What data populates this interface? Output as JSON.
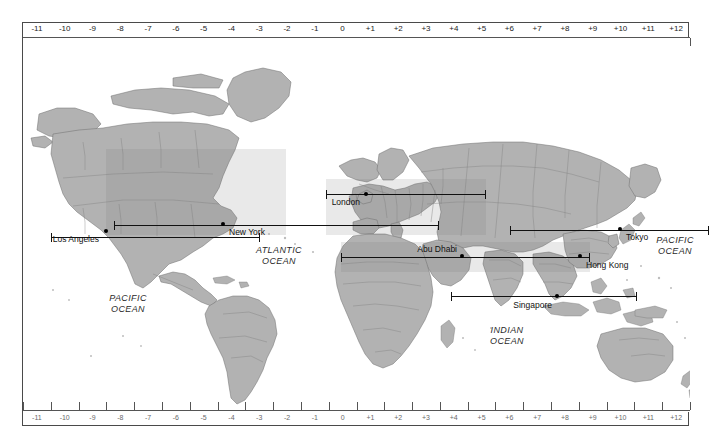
{
  "scale": {
    "top_labels": [
      "-11",
      "-10",
      "-9",
      "-8",
      "-7",
      "-6",
      "-5",
      "-4",
      "-3",
      "-2",
      "-1",
      "0",
      "+1",
      "+2",
      "+3",
      "+4",
      "+5",
      "+6",
      "+7",
      "+8",
      "+9",
      "+10",
      "+11",
      "+12"
    ],
    "bottom_labels": [
      "-11",
      "-10",
      "-9",
      "-8",
      "-7",
      "-6",
      "-5",
      "-4",
      "-3",
      "-2",
      "-1",
      "0",
      "+1",
      "+2",
      "+3",
      "+4",
      "+5",
      "+6",
      "+7",
      "+8",
      "+9",
      "+10",
      "+11",
      "+12"
    ],
    "offsets": [
      -11,
      -10,
      -9,
      -8,
      -7,
      -6,
      -5,
      -4,
      -3,
      -2,
      -1,
      0,
      1,
      2,
      3,
      4,
      5,
      6,
      7,
      8,
      9,
      10,
      11,
      12
    ],
    "min": -12,
    "max": 12
  },
  "cities": [
    {
      "name": "Los Angeles",
      "dot_x": 83,
      "dot_y": 208,
      "label_x": 76,
      "label_y": 211,
      "label_align": "right"
    },
    {
      "name": "New York",
      "dot_x": 200,
      "dot_y": 201,
      "label_x": 206,
      "label_y": 204,
      "label_align": "left"
    },
    {
      "name": "London",
      "dot_x": 343,
      "dot_y": 171,
      "label_x": 337,
      "label_y": 174,
      "label_align": "right"
    },
    {
      "name": "Abu Dhabi",
      "dot_x": 439,
      "dot_y": 233,
      "label_x": 434,
      "label_y": 221,
      "label_align": "right"
    },
    {
      "name": "Hong Kong",
      "dot_x": 557,
      "dot_y": 233,
      "label_x": 563,
      "label_y": 237,
      "label_align": "left"
    },
    {
      "name": "Tokyo",
      "dot_x": 597,
      "dot_y": 206,
      "label_x": 603,
      "label_y": 209,
      "label_align": "left"
    },
    {
      "name": "Singapore",
      "dot_x": 534,
      "dot_y": 273,
      "label_x": 529,
      "label_y": 277,
      "label_align": "right"
    }
  ],
  "route_bars": [
    {
      "name": "london-bar",
      "x": 303,
      "y": 171,
      "width": 160
    },
    {
      "name": "tokyo-bar",
      "x": 487,
      "y": 207,
      "width": 199
    },
    {
      "name": "losangeles-bar",
      "x": 28,
      "y": 214,
      "width": 209
    },
    {
      "name": "newyork-bar",
      "x": 91,
      "y": 202,
      "width": 325
    },
    {
      "name": "abudhabi-bar",
      "x": 318,
      "y": 234,
      "width": 249
    },
    {
      "name": "singapore-bar",
      "x": 428,
      "y": 273,
      "width": 186
    }
  ],
  "ocean_labels": [
    {
      "name": "PACIFIC OCEAN west",
      "line1": "PACIFIC",
      "line2": "OCEAN",
      "x": 105,
      "y": 270
    },
    {
      "name": "ATLANTIC OCEAN",
      "line1": "ATLANTIC",
      "line2": "OCEAN",
      "x": 256,
      "y": 222
    },
    {
      "name": "INDIAN OCEAN",
      "line1": "INDIAN",
      "line2": "OCEAN",
      "x": 484,
      "y": 302
    },
    {
      "name": "PACIFIC OCEAN east",
      "line1": "PACIFIC",
      "line2": "OCEAN",
      "x": 652,
      "y": 212
    }
  ],
  "colors": {
    "land_fill": "#b0b0b0",
    "land_stroke": "#707070",
    "ocean_fill": "#ffffff",
    "line": "#111111",
    "frame": "#4a4a4a",
    "band": "rgba(120,120,120,0.16)"
  }
}
